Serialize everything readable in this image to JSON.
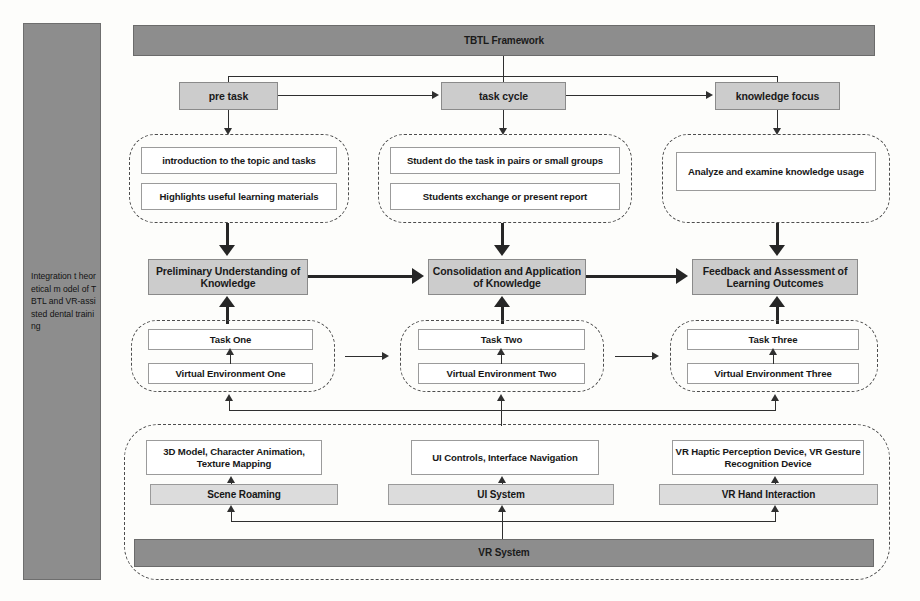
{
  "diagram": {
    "side_label": "Integration t heoretical m odel of TBTL and VR-assisted dental training",
    "colors": {
      "dark_band": "#8d8d8d",
      "mid_box": "#cccccc",
      "light_box": "#dcdcdc",
      "white_box": "#ffffff",
      "line": "#2f2f2f",
      "page_bg": "#fdfdfb"
    }
  },
  "framework": {
    "title": "TBTL Framework"
  },
  "phases": [
    {
      "label": "pre task"
    },
    {
      "label": "task cycle"
    },
    {
      "label": "knowledge focus"
    }
  ],
  "activity_groups": [
    {
      "group": "pre-task-activities",
      "items": [
        "introduction to the topic and tasks",
        "Highlights useful learning materials"
      ]
    },
    {
      "group": "task-cycle-activities",
      "items": [
        "Student do the task in pairs or small groups",
        "Students exchange or present report"
      ]
    },
    {
      "group": "knowledge-focus-activities",
      "items": [
        "Analyze and examine knowledge usage"
      ]
    }
  ],
  "outcomes": [
    {
      "label": "Preliminary Understanding of Knowledge"
    },
    {
      "label": "Consolidation and Application of  Knowledge"
    },
    {
      "label": "Feedback and Assessment of Learning Outcomes"
    }
  ],
  "task_groups": [
    {
      "task": "Task One",
      "environment": "Virtual Environment One"
    },
    {
      "task": "Task Two",
      "environment": "Virtual Environment Two"
    },
    {
      "task": "Task Three",
      "environment": "Virtual Environment Three"
    }
  ],
  "vr_system": {
    "title": "VR System",
    "modules": [
      {
        "module": "Scene Roaming",
        "capability": "3D Model, Character Animation, Texture Mapping"
      },
      {
        "module": "UI System",
        "capability": "UI Controls, Interface Navigation"
      },
      {
        "module": "VR Hand Interaction",
        "capability": "VR Haptic Perception Device,  VR Gesture Recognition Device"
      }
    ]
  }
}
